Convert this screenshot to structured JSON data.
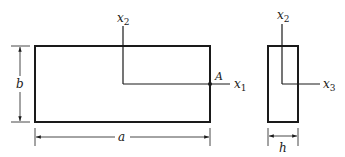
{
  "diagram": {
    "colors": {
      "stroke": "#1a1a1a",
      "background": "#ffffff"
    },
    "front_view": {
      "dimension_width_label": "a",
      "dimension_height_label": "b",
      "axis_vertical": {
        "base": "x",
        "subscript": "2"
      },
      "axis_horizontal": {
        "base": "x",
        "subscript": "1"
      },
      "point_label": "A"
    },
    "side_view": {
      "dimension_width_label": "h",
      "axis_vertical": {
        "base": "x",
        "subscript": "2"
      },
      "axis_horizontal": {
        "base": "x",
        "subscript": "3"
      }
    }
  }
}
